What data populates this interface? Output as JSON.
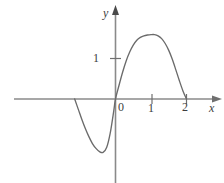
{
  "figure": {
    "name": "sine-curve-plot",
    "background_color": "#ffffff",
    "axis_color": "#8a8a8a",
    "curve_color": "#6b6b6b",
    "text_color": "#3d3d3d",
    "width": 224,
    "height": 183
  },
  "labels": {
    "y_axis": "y",
    "x_axis": "x",
    "origin": "0",
    "y_tick_1": "1",
    "x_tick_1": "1",
    "x_tick_2": "2"
  },
  "chart_data": {
    "type": "line",
    "title": "",
    "xlabel": "x",
    "ylabel": "y",
    "grid": false,
    "legend": "none",
    "xlim": [
      -1.15,
      2.6
    ],
    "ylim": [
      -1.6,
      2.0
    ],
    "x_ticks": [
      0,
      1,
      2
    ],
    "x_tick_labels": [
      "0",
      "1",
      "2"
    ],
    "y_ticks": [
      1
    ],
    "y_tick_labels": [
      "1"
    ],
    "annotations": [
      {
        "text": "y",
        "x": 0,
        "y": 1.95,
        "style": "italic"
      },
      {
        "text": "x",
        "x": 2.55,
        "y": -0.14,
        "style": "italic"
      }
    ],
    "series": [
      {
        "name": "curve",
        "x": [
          -1.15,
          -1.05,
          -0.95,
          -0.85,
          -0.75,
          -0.65,
          -0.55,
          -0.45,
          -0.35,
          -0.25,
          -0.15,
          -0.05,
          0.0,
          0.1,
          0.2,
          0.3,
          0.4,
          0.5,
          0.6,
          0.7,
          0.8,
          0.9,
          1.0,
          1.1,
          1.2,
          1.3,
          1.4,
          1.5,
          1.6,
          1.7,
          1.8,
          1.9,
          2.0
        ],
        "y": [
          0.0,
          -0.25,
          -0.5,
          -0.73,
          -0.93,
          -1.1,
          -1.22,
          -1.3,
          -1.32,
          -1.2,
          -0.85,
          -0.3,
          0.0,
          0.34,
          0.66,
          0.94,
          1.16,
          1.33,
          1.45,
          1.52,
          1.56,
          1.58,
          1.59,
          1.59,
          1.56,
          1.49,
          1.37,
          1.2,
          0.98,
          0.72,
          0.45,
          0.2,
          0.0
        ]
      }
    ]
  }
}
